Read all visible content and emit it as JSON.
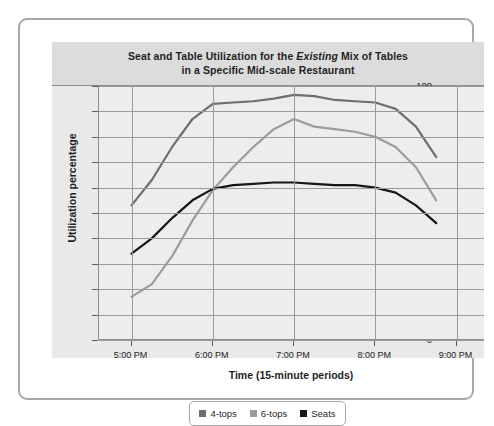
{
  "chart_data": {
    "type": "line",
    "title": "Seat and Table Utilization for the Existing Mix of Tables in a Specific Mid-scale Restaurant",
    "title_line1_pre": "Seat and Table Utilization for the ",
    "title_line1_em": "Existing",
    "title_line1_post": " Mix of Tables",
    "title_line2": "in a Specific Mid-scale Restaurant",
    "xlabel": "Time (15-minute periods)",
    "ylabel": "Utilization percentage",
    "ylim": [
      0,
      100
    ],
    "yticks": [
      0,
      10,
      20,
      30,
      40,
      50,
      60,
      70,
      80,
      90,
      100
    ],
    "ytick_labels": [
      "0",
      "10",
      "20",
      "30",
      "40",
      "50",
      "60",
      "70",
      "80",
      "90",
      "100"
    ],
    "xticks": [
      "5:00 PM",
      "6:00 PM",
      "7:00 PM",
      "8:00 PM",
      "9:00 PM"
    ],
    "xtick_hours": [
      17,
      18,
      19,
      20,
      21
    ],
    "xlim_hours": [
      16.6,
      21.35
    ],
    "grid": true,
    "legend_position": "bottom-center",
    "series": [
      {
        "name": "4-tops",
        "color": "#6e6e6e",
        "x_hours": [
          17.0,
          17.25,
          17.5,
          17.75,
          18.0,
          18.25,
          18.5,
          18.75,
          19.0,
          19.25,
          19.5,
          19.75,
          20.0,
          20.25,
          20.5,
          20.75
        ],
        "values": [
          53,
          63,
          76,
          87,
          93,
          93.5,
          94,
          95,
          96.5,
          96,
          94.5,
          94,
          93.5,
          91,
          84,
          72
        ]
      },
      {
        "name": "6-tops",
        "color": "#9c9c9c",
        "x_hours": [
          17.0,
          17.25,
          17.5,
          17.75,
          18.0,
          18.25,
          18.5,
          18.75,
          19.0,
          19.25,
          19.5,
          19.75,
          20.0,
          20.25,
          20.5,
          20.75
        ],
        "values": [
          17,
          22,
          33,
          47,
          59,
          68,
          76,
          83,
          87,
          84,
          83,
          82,
          80,
          76,
          68,
          55
        ]
      },
      {
        "name": "Seats",
        "color": "#161616",
        "x_hours": [
          17.0,
          17.25,
          17.5,
          17.75,
          18.0,
          18.25,
          18.5,
          18.75,
          19.0,
          19.25,
          19.5,
          19.75,
          20.0,
          20.25,
          20.5,
          20.75
        ],
        "values": [
          34,
          40,
          48,
          55,
          59.5,
          61,
          61.5,
          62,
          62,
          61.5,
          61,
          61,
          60,
          58,
          53,
          46
        ]
      }
    ]
  },
  "legend": {
    "items": [
      {
        "label": "4-tops",
        "color": "#6e6e6e"
      },
      {
        "label": "6-tops",
        "color": "#9c9c9c"
      },
      {
        "label": "Seats",
        "color": "#161616"
      }
    ]
  }
}
